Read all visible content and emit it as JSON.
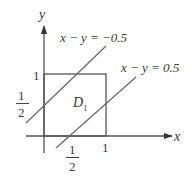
{
  "diagram": {
    "axes": {
      "x_label": "x",
      "y_label": "y"
    },
    "ticks": {
      "x_one": "1",
      "y_one": "1",
      "x_half_num": "1",
      "x_half_den": "2",
      "y_half_num": "1",
      "y_half_den": "2"
    },
    "region": {
      "label_main": "D",
      "label_sub": "1"
    },
    "lines": [
      {
        "label": "x − y = −0.5",
        "equation": "x - y = -0.5"
      },
      {
        "label": "x − y = 0.5",
        "equation": "x - y = 0.5"
      }
    ],
    "square": {
      "x_range": [
        0,
        1
      ],
      "y_range": [
        0,
        1
      ]
    },
    "colors": {
      "stroke": "#555555",
      "text": "#3a3a3a"
    }
  }
}
